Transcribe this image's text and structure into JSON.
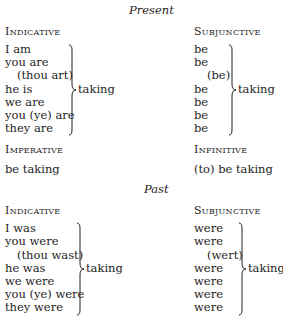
{
  "present": {
    "title": "Present",
    "indicative": {
      "heading": "Indicative",
      "lines": [
        "I am",
        "you are",
        "(thou art)",
        "he is",
        "we are",
        "you (ye) are",
        "they are"
      ],
      "result": "taking"
    },
    "subjunctive": {
      "heading": "Subjunctive",
      "lines": [
        "be",
        "be",
        "(be)",
        "be",
        "be",
        "be",
        "be"
      ],
      "result": "taking"
    },
    "imperative": {
      "heading": "Imperative",
      "value": "be taking"
    },
    "infinitive": {
      "heading": "Infinitive",
      "value": "(to) be taking"
    }
  },
  "past": {
    "title": "Past",
    "indicative": {
      "heading": "Indicative",
      "lines": [
        "I was",
        "you were",
        "(thou wast)",
        "he was",
        "we were",
        "you (ye) were",
        "they were"
      ],
      "result": "taking"
    },
    "subjunctive": {
      "heading": "Subjunctive",
      "lines": [
        "were",
        "were",
        "(wert)",
        "were",
        "were",
        "were",
        "were"
      ],
      "result": "taking"
    }
  }
}
